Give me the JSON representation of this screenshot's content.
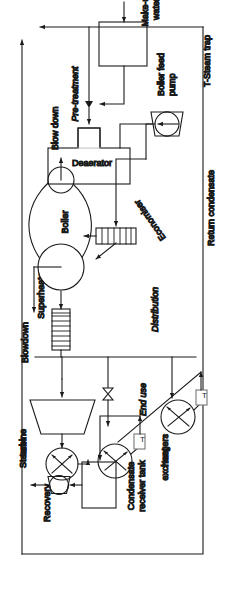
{
  "diagram": {
    "orientation_deg": -90,
    "stroke_color": "#1a1a1a",
    "background_color": "#ffffff",
    "sections": [
      {
        "id": "recovery",
        "label": "Recovery",
        "italic": false
      },
      {
        "id": "distribution",
        "label": "Distribution",
        "italic": true
      },
      {
        "id": "enduse",
        "label": "End use",
        "italic": true
      },
      {
        "id": "generation",
        "label": "Generation",
        "italic": true
      },
      {
        "id": "pretreatment",
        "label": "Pre-treatment",
        "italic": true
      }
    ],
    "equipment": [
      {
        "id": "steam-turbine",
        "label": "Steam\nturbine",
        "label_line1": "Steam",
        "label_line2": "turbine",
        "symbol": "trapezoid"
      },
      {
        "id": "heat-exchangers",
        "label": "Heat\nexchangers",
        "label_line1": "Heat",
        "label_line2": "exchangers",
        "symbol": "circle-diagonal-arrows"
      },
      {
        "id": "condensate-receiver-tank",
        "label": "Condensate\nreceiver tank",
        "label_line1": "Condensate",
        "label_line2": "receiver tank",
        "symbol": "rectangle"
      },
      {
        "id": "superheater",
        "label": "Superheater",
        "symbol": "finned-rectangle"
      },
      {
        "id": "boiler",
        "label": "Boiler",
        "symbol": "lens-with-drums"
      },
      {
        "id": "economiser",
        "label": "Economiser",
        "symbol": "finned-bar"
      },
      {
        "id": "deaerator",
        "label": "Deaerator",
        "symbol": "rectangle-with-neck"
      },
      {
        "id": "boiler-feed-pump",
        "label": "Boiler feed\npump",
        "label_line1": "Boiler feed",
        "label_line2": "pump",
        "symbol": "pump"
      },
      {
        "id": "pre-treatment-unit",
        "label": "",
        "symbol": "rectangle"
      }
    ],
    "streams": [
      {
        "id": "blowdown-tap",
        "label": "Blowdown"
      },
      {
        "id": "blow-down-out",
        "label": "Blow down"
      },
      {
        "id": "return-condensate",
        "label": "Return condensate"
      },
      {
        "id": "make-up-water",
        "label": "Make-up\nwater",
        "label_line1": "Make-up",
        "label_line2": "water"
      }
    ],
    "legend": {
      "items": [
        {
          "symbol": "T",
          "text": "T-Steam trap"
        }
      ]
    },
    "steam_traps": [
      {
        "id": "steam-trap-1",
        "glyph": "T"
      },
      {
        "id": "steam-trap-2",
        "glyph": "T"
      }
    ],
    "valves": [
      {
        "id": "valve-1",
        "symbol": "bowtie"
      }
    ]
  }
}
